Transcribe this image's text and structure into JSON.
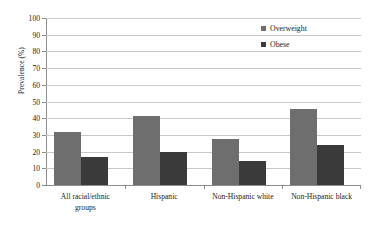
{
  "chart_data": {
    "type": "bar",
    "title": "",
    "xlabel": "",
    "ylabel": "Prevalence (%)",
    "ylim": [
      0,
      100
    ],
    "ytick_step": 10,
    "yticks": [
      0,
      10,
      20,
      30,
      40,
      50,
      60,
      70,
      80,
      90,
      100
    ],
    "ytick_labels": [
      "0",
      "10",
      "20",
      "30",
      "40",
      "50",
      "60",
      "70",
      "80",
      "90",
      "100"
    ],
    "grid": true,
    "grid_axis": "y",
    "legend_position": "top-right",
    "categories": [
      "All racial/ethnic groups",
      "Hispanic",
      "Non-Hispanic white",
      "Non-Hispanic black"
    ],
    "category_lines": [
      [
        "All racial/ethnic",
        "groups"
      ],
      [
        "Hispanic"
      ],
      [
        "Non-Hispanic white"
      ],
      [
        "Non-Hispanic black"
      ]
    ],
    "series": [
      {
        "name": "Overweight",
        "color": "#6e6e6e",
        "values": [
          32,
          41.5,
          27.5,
          45.5
        ]
      },
      {
        "name": "Obese",
        "color": "#3a3a3a",
        "values": [
          16.5,
          19.5,
          14.5,
          24
        ]
      }
    ]
  },
  "legend": {
    "items": [
      {
        "label": "Overweight",
        "color": "#6e6e6e"
      },
      {
        "label": "Obese",
        "color": "#3a3a3a"
      }
    ]
  },
  "axes": {
    "y_title": "Prevalence (%)"
  },
  "colors": {
    "overweight": "#6e6e6e",
    "obese": "#3a3a3a",
    "gridline": "#c8c8c8",
    "axis": "#8d8d8d",
    "background": "#ffffff",
    "text": "#1a1a1a"
  }
}
